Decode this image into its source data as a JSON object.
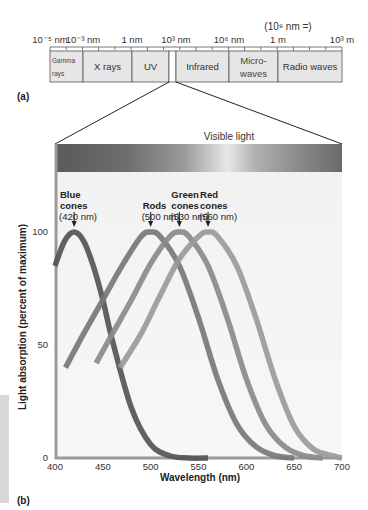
{
  "panel_a": {
    "label": "(a)",
    "scale_labels": [
      {
        "text": "10⁻⁵ nm",
        "x": 50
      },
      {
        "text": "10⁻³ nm",
        "x": 83
      },
      {
        "text": "1 nm",
        "x": 132
      },
      {
        "text": "10³ nm",
        "x": 176
      },
      {
        "text": "10⁶ nm",
        "x": 229
      },
      {
        "text": "1 m",
        "x": 278
      },
      {
        "text": "10³ m",
        "x": 342
      }
    ],
    "scale_note": "(10⁹ nm =)",
    "bands": [
      {
        "name": "Gamma rays",
        "lines": [
          "Gamma",
          "rays"
        ],
        "x0": 50,
        "x1": 83,
        "small": true
      },
      {
        "name": "X rays",
        "lines": [
          "X rays"
        ],
        "x0": 83,
        "x1": 132
      },
      {
        "name": "UV",
        "lines": [
          "UV"
        ],
        "x0": 132,
        "x1": 169
      },
      {
        "name": "Visible",
        "lines": [],
        "x0": 169,
        "x1": 176,
        "visible": true
      },
      {
        "name": "Infrared",
        "lines": [
          "Infrared"
        ],
        "x0": 176,
        "x1": 229
      },
      {
        "name": "Microwaves",
        "lines": [
          "Micro-",
          "waves"
        ],
        "x0": 229,
        "x1": 278
      },
      {
        "name": "Radio waves",
        "lines": [
          "Radio waves"
        ],
        "x0": 278,
        "x1": 342
      }
    ]
  },
  "panel_b": {
    "label": "(b)",
    "visible_light_label": "Visible light"
  },
  "chart_data": {
    "type": "line",
    "title": "Visible light",
    "xlabel": "Wavelength (nm)",
    "ylabel": "Light absorption (percent of maximum)",
    "xlim": [
      400,
      700
    ],
    "ylim": [
      0,
      100
    ],
    "xticks": [
      400,
      450,
      500,
      550,
      600,
      650,
      700
    ],
    "yticks": [
      0,
      50,
      100
    ],
    "grid": false,
    "legend_position": "annotations above peaks",
    "series": [
      {
        "name": "Blue cones",
        "label_lines": [
          "Blue",
          "cones",
          "(420 nm)"
        ],
        "peak_nm": 420,
        "color": "#555555",
        "x": [
          400,
          410,
          420,
          430,
          440,
          450,
          460,
          480,
          500,
          520,
          540,
          560
        ],
        "y": [
          85,
          96,
          100,
          96,
          85,
          70,
          52,
          22,
          6,
          1,
          0,
          0
        ],
        "start_nm": 400
      },
      {
        "name": "Rods",
        "label_lines": [
          "Rods",
          "(500 nm)"
        ],
        "peak_nm": 500,
        "color": "#777777",
        "x": [
          411,
          430,
          450,
          470,
          490,
          500,
          510,
          530,
          550,
          570,
          590,
          610,
          630,
          650
        ],
        "y": [
          40,
          55,
          70,
          85,
          98,
          100,
          98,
          85,
          62,
          35,
          15,
          5,
          1,
          0
        ]
      },
      {
        "name": "Green cones",
        "label_lines": [
          "Green",
          "cones",
          "(530 nm)"
        ],
        "peak_nm": 530,
        "color": "#8a8a8a",
        "x": [
          443,
          460,
          480,
          500,
          520,
          530,
          540,
          560,
          580,
          600,
          620,
          640,
          660,
          680
        ],
        "y": [
          42,
          55,
          70,
          86,
          98,
          100,
          98,
          85,
          62,
          35,
          15,
          5,
          1,
          0
        ]
      },
      {
        "name": "Red cones",
        "label_lines": [
          "Red",
          "cones",
          "(560 nm)"
        ],
        "peak_nm": 560,
        "color": "#9a9a9a",
        "x": [
          468,
          490,
          510,
          530,
          550,
          560,
          570,
          590,
          610,
          630,
          650,
          670,
          690,
          700
        ],
        "y": [
          40,
          55,
          72,
          88,
          98,
          100,
          98,
          85,
          62,
          35,
          14,
          4,
          1,
          0
        ]
      }
    ]
  }
}
